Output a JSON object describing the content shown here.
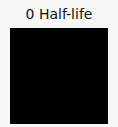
{
  "title": "0 Half-life",
  "swatch": {
    "color": "#000000"
  }
}
